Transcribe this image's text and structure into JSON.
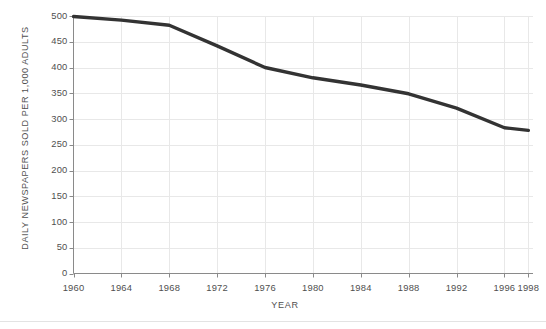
{
  "chart_data": {
    "type": "line",
    "title": "",
    "xlabel": "YEAR",
    "ylabel": "DAILY NEWSPAPERS SOLD PER 1,000 ADULTS",
    "xlim": [
      1960,
      1998
    ],
    "ylim": [
      0,
      500
    ],
    "grid": true,
    "legend": "none",
    "line_color": "#333333",
    "grid_color": "#e8e8e8",
    "axis_color": "#8a8a8a",
    "text_color": "#4f4f4f",
    "y_ticks": [
      0,
      50,
      100,
      150,
      200,
      250,
      300,
      350,
      400,
      450,
      500
    ],
    "y_tick_labels": [
      "0",
      "50",
      "100",
      "150",
      "200",
      "250",
      "300",
      "350",
      "400",
      "450",
      "500"
    ],
    "x_ticks": [
      1960,
      1964,
      1968,
      1972,
      1976,
      1980,
      1984,
      1988,
      1992,
      1996,
      1998
    ],
    "x_tick_labels": [
      "1960",
      "1964",
      "1968",
      "1972",
      "1976",
      "1980",
      "1984",
      "1988",
      "1992",
      "1996",
      "1998"
    ],
    "x": [
      1960,
      1964,
      1968,
      1972,
      1976,
      1980,
      1984,
      1988,
      1992,
      1996,
      1998
    ],
    "values": [
      499,
      492,
      482,
      442,
      400,
      380,
      366,
      349,
      321,
      283,
      278
    ],
    "series": [
      {
        "name": "Daily newspapers sold per 1,000 adults",
        "x": [
          1960,
          1964,
          1968,
          1972,
          1976,
          1980,
          1984,
          1988,
          1992,
          1996,
          1998
        ],
        "values": [
          499,
          492,
          482,
          442,
          400,
          380,
          366,
          349,
          321,
          283,
          278
        ]
      }
    ]
  }
}
